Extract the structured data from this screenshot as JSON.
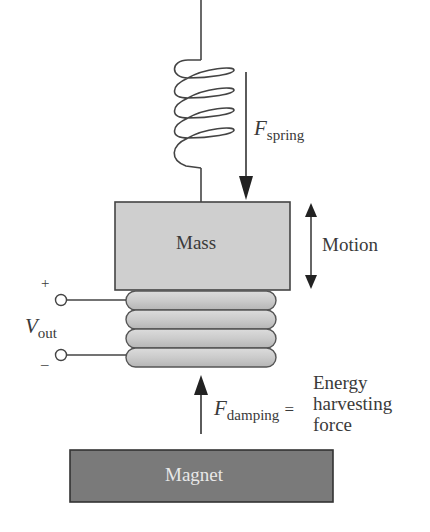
{
  "diagram": {
    "labels": {
      "mass": "Mass",
      "magnet": "Magnet",
      "motion": "Motion",
      "f_spring_main": "F",
      "f_spring_sub": "spring",
      "v_out_main": "V",
      "v_out_sub": "out",
      "plus": "+",
      "minus": "–",
      "f_damping_main": "F",
      "f_damping_sub": "damping",
      "equals": "=",
      "harvest_line1": "Energy",
      "harvest_line2": "harvesting",
      "harvest_line3": "force"
    },
    "components": [
      "spring",
      "mass",
      "coil",
      "terminals",
      "magnet",
      "spring-force-arrow",
      "motion-arrow",
      "damping-force-arrow"
    ],
    "coil_turns": 4,
    "spring_turns": 5,
    "colors": {
      "mass_fill": "#cfcfcf",
      "coil_fill": "#c9c9c9",
      "magnet_fill": "#7a7a7a",
      "magnet_text": "#e8e8e8",
      "stroke": "#3a3a3a"
    }
  }
}
